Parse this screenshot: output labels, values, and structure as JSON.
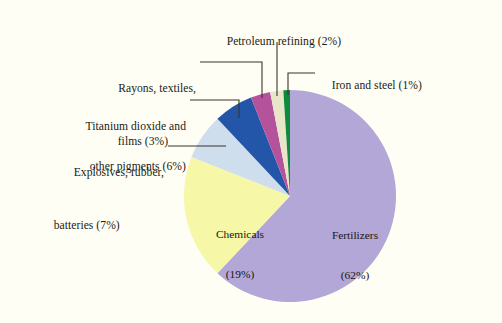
{
  "figure": {
    "background_color": "#fffef4",
    "caption": "",
    "width": 502,
    "height": 323
  },
  "chart_data": {
    "type": "pie",
    "title": "",
    "xlabel": "",
    "ylabel": "",
    "legend_position": "callout-labels",
    "grid": false,
    "units": "percent",
    "total": 100,
    "start_angle_deg": -90,
    "direction": "clockwise",
    "categories": [
      "Fertilizers",
      "Chemicals",
      "Explosives, rubber, batteries",
      "Titanium dioxide and other pigments",
      "Rayons, textiles, films",
      "Petroleum refining",
      "Iron and steel"
    ],
    "values": [
      62,
      19,
      7,
      6,
      3,
      2,
      1
    ],
    "colors": [
      "#b3a7d8",
      "#f7f7a8",
      "#cfdeec",
      "#2355a8",
      "#b4539c",
      "#e8e6c8",
      "#0d8a3c"
    ],
    "slices": [
      {
        "name": "Fertilizers",
        "value": 62,
        "value_text": "(62%)",
        "label_line1": "Fertilizers",
        "label_line2": "(62%)",
        "color": "#b3a7d8",
        "label_placement": "inside"
      },
      {
        "name": "Chemicals",
        "value": 19,
        "value_text": "(19%)",
        "label_line1": "Chemicals",
        "label_line2": "(19%)",
        "color": "#f7f7a8",
        "label_placement": "inside"
      },
      {
        "name": "Explosives, rubber, batteries",
        "value": 7,
        "value_text": "(7%)",
        "label_line1": "Explosives, rubber,",
        "label_line2": "batteries (7%)",
        "color": "#cfdeec",
        "label_placement": "callout-left"
      },
      {
        "name": "Titanium dioxide and other pigments",
        "value": 6,
        "value_text": "(6%)",
        "label_line1": "Titanium dioxide and",
        "label_line2": "other pigments (6%)",
        "color": "#2355a8",
        "label_placement": "callout-left"
      },
      {
        "name": "Rayons, textiles, films",
        "value": 3,
        "value_text": "(3%)",
        "label_line1": "Rayons, textiles,",
        "label_line2": "films (3%)",
        "color": "#b4539c",
        "label_placement": "callout-left"
      },
      {
        "name": "Petroleum refining",
        "value": 2,
        "value_text": "(2%)",
        "label_line1": "Petroleum refining (2%)",
        "label_line2": "",
        "color": "#e8e6c8",
        "label_placement": "callout-top"
      },
      {
        "name": "Iron and steel",
        "value": 1,
        "value_text": "(1%)",
        "label_line1": "Iron and steel (1%)",
        "label_line2": "",
        "color": "#0d8a3c",
        "label_placement": "callout-right"
      }
    ]
  },
  "labels": {
    "petroleum": "Petroleum refining (2%)",
    "iron_and_steel": "Iron and steel (1%)",
    "rayons_l1": "Rayons, textiles,",
    "rayons_l2": "films (3%)",
    "titanium_l1": "Titanium dioxide and",
    "titanium_l2": "other pigments (6%)",
    "explosives_l1": "Explosives, rubber,",
    "explosives_l2": "batteries (7%)",
    "chemicals_l1": "Chemicals",
    "chemicals_l2": "(19%)",
    "fertilizers_l1": "Fertilizers",
    "fertilizers_l2": "(62%)"
  }
}
